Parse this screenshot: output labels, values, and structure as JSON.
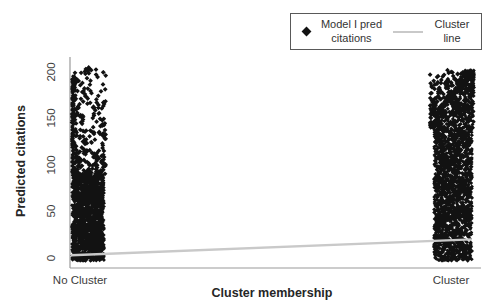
{
  "figure": {
    "background": "#ffffff"
  },
  "legend": {
    "entries": [
      {
        "marker": "diamond",
        "label_line1": "Model I pred",
        "label_line2": "citations"
      },
      {
        "marker": "line",
        "label_line1": "Cluster",
        "label_line2": "line"
      }
    ]
  },
  "chart_data": {
    "type": "scatter",
    "title": "",
    "xlabel": "Cluster membership",
    "ylabel": "Predicted citations",
    "x_categories": [
      "No Cluster",
      "Cluster"
    ],
    "ylim": [
      0,
      200
    ],
    "y_ticks": [
      0,
      50,
      100,
      150,
      200
    ],
    "grid": "off",
    "legend_position": "top-right",
    "axis_color": "#9a9a9a",
    "series": [
      {
        "name": "Model I pred citations",
        "type": "scatter",
        "marker": "diamond",
        "color": "#121212",
        "description": "Dense vertical bands of predicted citations at each category; solid mass at low values thinning to sparse points near 200",
        "clusters": [
          {
            "category": "No Cluster",
            "y_range": [
              0,
              205
            ],
            "solid_up_to": 88,
            "edge_side": "left",
            "edge_column_up_to": 196,
            "sparse_above_count": 270
          },
          {
            "category": "Cluster",
            "y_range": [
              0,
              202
            ],
            "solid_up_to": 140,
            "edge_side": "right",
            "edge_column_up_to": 200,
            "sparse_above_count": 190
          }
        ]
      },
      {
        "name": "Cluster line",
        "type": "line",
        "color": "#c9c9c9",
        "x": [
          "No Cluster",
          "Cluster"
        ],
        "values": [
          3,
          20
        ]
      }
    ]
  }
}
